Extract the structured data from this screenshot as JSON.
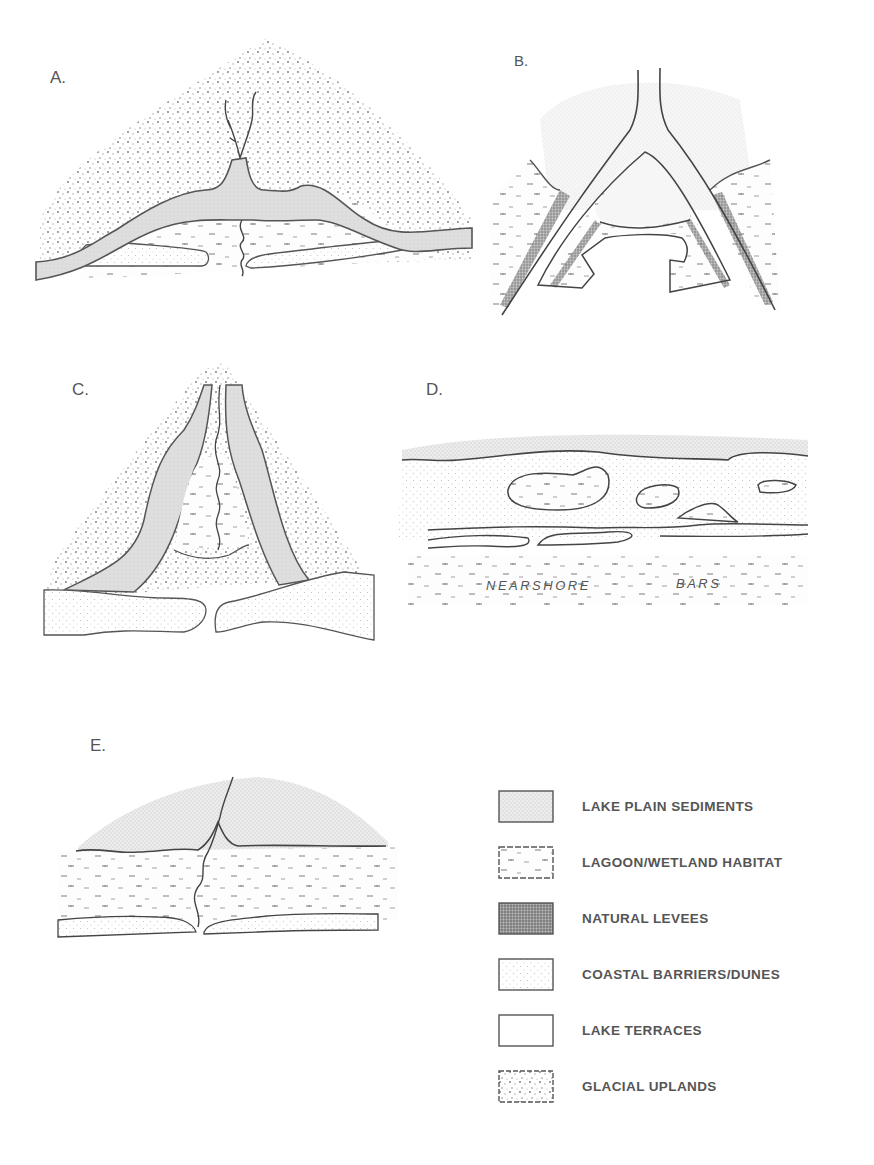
{
  "figure": {
    "panels": [
      {
        "id": "A",
        "label": "A."
      },
      {
        "id": "B",
        "label": "B."
      },
      {
        "id": "C",
        "label": "C."
      },
      {
        "id": "D",
        "label": "D.",
        "annotations": [
          "NEARSHORE",
          "BARS"
        ]
      },
      {
        "id": "E",
        "label": "E."
      }
    ],
    "legend": {
      "items": [
        {
          "label": "LAKE PLAIN SEDIMENTS",
          "pattern": "fine-dense-stipple"
        },
        {
          "label": "LAGOON/WETLAND HABITAT",
          "pattern": "dashes"
        },
        {
          "label": "NATURAL LEVEES",
          "pattern": "dark-dense-stipple"
        },
        {
          "label": "COASTAL BARRIERS/DUNES",
          "pattern": "light-dots"
        },
        {
          "label": "LAKE TERRACES",
          "pattern": "blank"
        },
        {
          "label": "GLACIAL UPLANDS",
          "pattern": "coarse-dots"
        }
      ]
    }
  }
}
